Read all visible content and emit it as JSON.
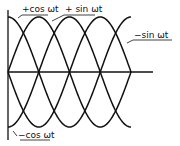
{
  "diagram": {
    "title": "",
    "stroke_color": "#111111",
    "background": "#ffffff",
    "axes": {
      "origin": [
        8,
        72
      ],
      "x_axis_end": 153,
      "y_axis_top": 10,
      "y_axis_bottom": 140
    },
    "amplitude_px": 55,
    "quarter_period_px": 30.75,
    "cycles": 1,
    "labels": {
      "plus_cos": "+cos ωt",
      "plus_sin": "+ sin ωt",
      "minus_sin": "−sin ωt",
      "minus_cos": "−cos ωt"
    }
  },
  "chart_data": {
    "type": "line",
    "title": "",
    "xlabel": "ωt",
    "ylabel": "",
    "x": [
      0,
      90,
      180,
      270,
      360
    ],
    "series": [
      {
        "name": "+cos ωt",
        "values": [
          1,
          0,
          -1,
          0,
          1
        ]
      },
      {
        "name": "+ sin ωt",
        "values": [
          0,
          1,
          0,
          -1,
          0
        ]
      },
      {
        "name": "−sin ωt",
        "values": [
          0,
          -1,
          0,
          1,
          0
        ]
      },
      {
        "name": "−cos ωt",
        "values": [
          -1,
          0,
          1,
          0,
          -1
        ]
      }
    ],
    "xlim": [
      0,
      360
    ],
    "ylim": [
      -1,
      1
    ],
    "grid": false,
    "legend": "inline labels with leader lines"
  }
}
